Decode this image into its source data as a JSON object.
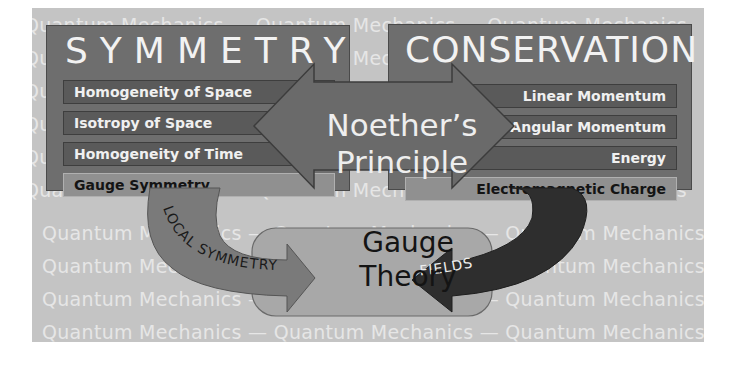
{
  "background": {
    "repeat_text": [
      "Quantum",
      "Mechanics",
      "—"
    ],
    "rows": [
      "Quantum  Mechanics  —  Quantum  Mechanics  —  Quantum  Mechanics",
      "Quantum  Mechanics  —  Quantum  Mechanics  —  Quantum  Mechanics",
      "Quantum  Mechanics  —  Quantum  Mechanics  —  Quantum  Mechanics",
      "Quantum  Mechanics  —  Quantum  Mechanics  —  Quantum  Mechanics",
      "Quantum  Mechanics  —  Quantum  Mechanics  —  Quantum  Mechanics",
      "Quantum  Mechanics  —  Quantum  Mechanics  —  Quantum  Mechanics",
      "Quantum  Mechanics  —  Quantum  Mechanics  —  Quantum  Mechanics",
      "Quantum  Mechanics  —  Quantum  Mechanics  —  Quantum  Mechanics",
      "Quantum  Mechanics  —  Quantum  Mechanics  —  Quantum  Mechanics",
      "Quantum  Mechanics  —  Quantum  Mechanics  —  Quantum  Mechanics"
    ]
  },
  "symmetry": {
    "title": "SYMMETRY",
    "items": [
      {
        "label": "Homogeneity of Space"
      },
      {
        "label": "Isotropy of Space"
      },
      {
        "label": "Homogeneity of Time"
      },
      {
        "label": "Gauge Symmetry"
      }
    ]
  },
  "conservation": {
    "title": "CONSERVATION",
    "items": [
      {
        "label": "Linear Momentum"
      },
      {
        "label": "Angular Momentum"
      },
      {
        "label": "Energy"
      },
      {
        "label": "Electromagnetic Charge"
      }
    ]
  },
  "center": {
    "line1": "Noether’s",
    "line2": "Principle"
  },
  "result": {
    "line1": "Gauge",
    "line2": "Theory"
  },
  "arrows": {
    "left_label": "LOCAL SYMMETRY",
    "right_label": "FIELDS"
  },
  "colors": {
    "background": "#c4c4c4",
    "panel": "#6e6e6e",
    "bar_dark": "#5a5a5a",
    "bar_light": "#909090",
    "arrow_mid": "#7a7a7a",
    "arrow_dark": "#2e2e2e",
    "result_box": "#a8a8a8"
  }
}
